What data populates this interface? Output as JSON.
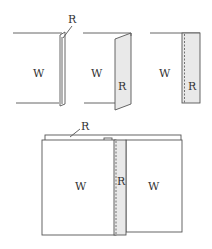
{
  "diagram": {
    "colors": {
      "line": "#555555",
      "strip_fill": "#e9e9e9",
      "background": "#ffffff"
    },
    "step1": {
      "panel_label": "W",
      "strip_label": "R"
    },
    "step2": {
      "panel_label": "W",
      "strip_label": "R"
    },
    "step3": {
      "panel_label": "W",
      "strip_label": "R"
    },
    "step4": {
      "left_panel_label": "W",
      "right_panel_label": "W",
      "strip_label": "R",
      "top_strip_label": "R"
    }
  }
}
